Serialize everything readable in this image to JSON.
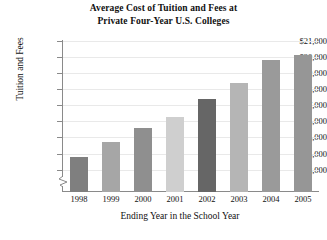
{
  "chart_data": {
    "type": "bar",
    "title": "Average Cost of Tuition and Fees at Private Four-Year U.S. Colleges",
    "title_line1": "Average Cost of Tuition and Fees at",
    "title_line2": "Private Four-Year U.S. Colleges",
    "xlabel": "Ending Year in the School Year",
    "ylabel": "Tuition and Fees",
    "categories": [
      "1998",
      "1999",
      "2000",
      "2001",
      "2002",
      "2003",
      "2004",
      "2005"
    ],
    "values": [
      13800,
      14700,
      15600,
      16300,
      17400,
      18400,
      19800,
      20100
    ],
    "ylim": [
      12600,
      21000
    ],
    "ytick_values": [
      13000,
      14000,
      15000,
      16000,
      17000,
      18000,
      19000,
      20000,
      21000
    ],
    "ytick_labels": [
      "$13,000",
      "$14,000",
      "$15,000",
      "$16,000",
      "$17,000",
      "$18,000",
      "$19,000",
      "$20,000",
      "$21,000"
    ],
    "axis_break": true,
    "grid": true,
    "legend": "none",
    "bar_colors": [
      "#7f7f7f",
      "#a6a6a6",
      "#8f8f8f",
      "#cfcfcf",
      "#666666",
      "#b5b5b5",
      "#9a9a9a",
      "#969696"
    ],
    "grid_color": "#e9e9e9",
    "axis_color": "#8a8a8a"
  }
}
